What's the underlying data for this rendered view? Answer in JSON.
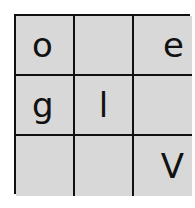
{
  "puzzle": {
    "rows": 3,
    "cols": 3,
    "cells": [
      [
        "o",
        "",
        "e"
      ],
      [
        "g",
        "l",
        ""
      ],
      [
        "",
        "",
        "V"
      ]
    ]
  },
  "colors": {
    "cell_background": "#d8d8d8",
    "border": "#111111",
    "text": "#111111"
  }
}
